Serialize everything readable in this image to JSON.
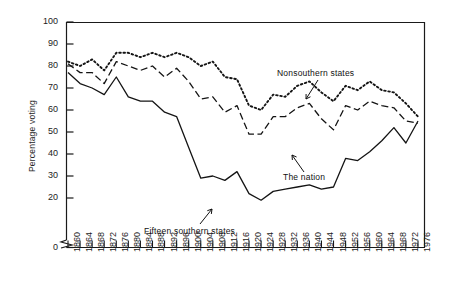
{
  "chart_data": {
    "type": "line",
    "title": "",
    "xlabel": "",
    "ylabel": "Percentage voting",
    "ylim": [
      0,
      100
    ],
    "y_ticks": [
      0,
      20,
      30,
      40,
      50,
      60,
      70,
      80,
      90,
      100
    ],
    "y_axis_break": true,
    "grid": false,
    "legend_position": "inline-annotations",
    "x": [
      1860,
      1864,
      1868,
      1872,
      1876,
      1880,
      1884,
      1888,
      1892,
      1896,
      1900,
      1904,
      1908,
      1912,
      1916,
      1920,
      1924,
      1928,
      1932,
      1936,
      1940,
      1944,
      1948,
      1952,
      1956,
      1960,
      1964,
      1968,
      1972,
      1976
    ],
    "categories": [
      "1860",
      "1864",
      "1868",
      "1872",
      "1876",
      "1880",
      "1884",
      "1888",
      "1892",
      "1896",
      "1900",
      "1904",
      "1908",
      "1912",
      "1916",
      "1920",
      "1924",
      "1928",
      "1932",
      "1936",
      "1940",
      "1944",
      "1948",
      "1952",
      "1956",
      "1960",
      "1964",
      "1968",
      "1972",
      "1976"
    ],
    "series": [
      {
        "name": "Nonsouthern states",
        "style": "dotted",
        "values": [
          82,
          80,
          83,
          78,
          86,
          86,
          84,
          86,
          84,
          86,
          84,
          80,
          82,
          75,
          74,
          62,
          60,
          67,
          66,
          71,
          73,
          68,
          64,
          71,
          69,
          73,
          69,
          68,
          63,
          57
        ]
      },
      {
        "name": "The nation",
        "style": "dashed",
        "values": [
          81,
          77,
          77,
          72,
          82,
          80,
          78,
          80,
          75,
          79,
          73,
          65,
          66,
          59,
          62,
          49,
          49,
          57,
          57,
          61,
          63,
          56,
          51,
          62,
          60,
          64,
          62,
          61,
          55,
          54
        ]
      },
      {
        "name": "Fifteen southern states",
        "style": "solid",
        "values": [
          77,
          72,
          70,
          67,
          75,
          66,
          64,
          64,
          59,
          57,
          43,
          29,
          30,
          28,
          32,
          22,
          19,
          23,
          24,
          25,
          26,
          24,
          25,
          38,
          37,
          41,
          46,
          52,
          45,
          55
        ]
      }
    ],
    "annotations": [
      {
        "text": "Nonsouthern states",
        "points_to_series": "Nonsouthern states",
        "points_to_year": 1936
      },
      {
        "text": "The nation",
        "points_to_series": "The nation",
        "points_to_year": 1944
      },
      {
        "text": "Fifteen southern states",
        "points_to_series": "Fifteen southern states",
        "points_to_year": 1932
      }
    ]
  }
}
